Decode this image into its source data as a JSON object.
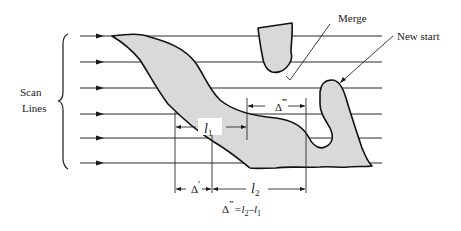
{
  "diagram": {
    "type": "scan-line region tracking",
    "labels": {
      "scan_lines_1": "Scan",
      "scan_lines_2": "Lines",
      "merge": "Merge",
      "new_start": "New start",
      "l1": "l",
      "l1_sub": "1",
      "l2": "l",
      "l2_sub": "2",
      "delta_prime": "Δ",
      "delta_prime_mark": "′",
      "delta_triple": "Δ",
      "delta_triple_mark": "‴",
      "formula_delta": "Δ",
      "formula_mark": "″",
      "formula_rhs": "=l",
      "formula_sub2": "2",
      "formula_minus": "–l",
      "formula_sub1": "1"
    },
    "scan_line_count": 6,
    "colors": {
      "region_fill": "#d9d9d9",
      "outline": "#111111",
      "line": "#2a2a2a"
    }
  }
}
